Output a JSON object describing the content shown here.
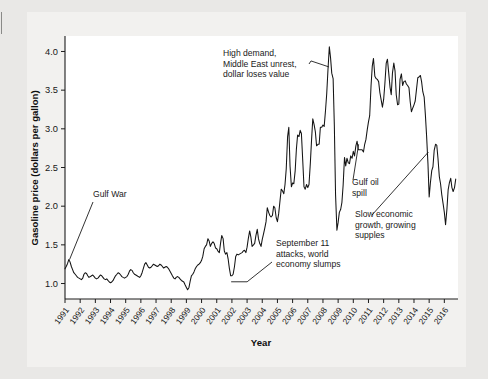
{
  "figure": {
    "background_color": "#e9e8e6",
    "panel_color": "#f2f1ef",
    "plot_color": "#ffffff",
    "line_color": "#141414"
  },
  "chart_data": {
    "type": "line",
    "title": "",
    "xlabel": "Year",
    "ylabel": "Gasoline price (dollars per gallon)",
    "xlim": [
      1991,
      2016.9
    ],
    "ylim": [
      0.8,
      4.2
    ],
    "ytick_labels": [
      "1.0",
      "1.5",
      "2.0",
      "2.5",
      "3.0",
      "3.5",
      "4.0"
    ],
    "ytick_values": [
      1.0,
      1.5,
      2.0,
      2.5,
      3.0,
      3.5,
      4.0
    ],
    "xtick_labels": [
      "1991",
      "1992",
      "1993",
      "1994",
      "1995",
      "1996",
      "1997",
      "1998",
      "1999",
      "2000",
      "2001",
      "2002",
      "2003",
      "2004",
      "2005",
      "2006",
      "2007",
      "2008",
      "2009",
      "2010",
      "2011",
      "2012",
      "2013",
      "2014",
      "2015",
      "2016"
    ],
    "xtick_values": [
      1991,
      1992,
      1993,
      1994,
      1995,
      1996,
      1997,
      1998,
      1999,
      2000,
      2001,
      2002,
      2003,
      2004,
      2005,
      2006,
      2007,
      2008,
      2009,
      2010,
      2011,
      2012,
      2013,
      2014,
      2015,
      2016
    ],
    "grid": false,
    "legend": null,
    "series": [
      {
        "name": "Gasoline price",
        "x": [
          1991.0,
          1991.08,
          1991.17,
          1991.25,
          1991.33,
          1991.42,
          1991.5,
          1991.58,
          1991.67,
          1991.75,
          1991.83,
          1991.92,
          1992.0,
          1992.08,
          1992.17,
          1992.25,
          1992.33,
          1992.42,
          1992.5,
          1992.58,
          1992.67,
          1992.75,
          1992.83,
          1992.92,
          1993.0,
          1993.08,
          1993.17,
          1993.25,
          1993.33,
          1993.42,
          1993.5,
          1993.58,
          1993.67,
          1993.75,
          1993.83,
          1993.92,
          1994.0,
          1994.08,
          1994.17,
          1994.25,
          1994.33,
          1994.42,
          1994.5,
          1994.58,
          1994.67,
          1994.75,
          1994.83,
          1994.92,
          1995.0,
          1995.08,
          1995.17,
          1995.25,
          1995.33,
          1995.42,
          1995.5,
          1995.58,
          1995.67,
          1995.75,
          1995.83,
          1995.92,
          1996.0,
          1996.08,
          1996.17,
          1996.25,
          1996.33,
          1996.42,
          1996.5,
          1996.58,
          1996.67,
          1996.75,
          1996.83,
          1996.92,
          1997.0,
          1997.08,
          1997.17,
          1997.25,
          1997.33,
          1997.42,
          1997.5,
          1997.58,
          1997.67,
          1997.75,
          1997.83,
          1997.92,
          1998.0,
          1998.08,
          1998.17,
          1998.25,
          1998.33,
          1998.42,
          1998.5,
          1998.58,
          1998.67,
          1998.75,
          1998.83,
          1998.92,
          1999.0,
          1999.08,
          1999.17,
          1999.25,
          1999.33,
          1999.42,
          1999.5,
          1999.58,
          1999.67,
          1999.75,
          1999.83,
          1999.92,
          2000.0,
          2000.08,
          2000.17,
          2000.25,
          2000.33,
          2000.42,
          2000.5,
          2000.58,
          2000.67,
          2000.75,
          2000.83,
          2000.92,
          2001.0,
          2001.08,
          2001.17,
          2001.25,
          2001.33,
          2001.42,
          2001.5,
          2001.58,
          2001.67,
          2001.75,
          2001.83,
          2001.92,
          2002.0,
          2002.08,
          2002.17,
          2002.25,
          2002.33,
          2002.42,
          2002.5,
          2002.58,
          2002.67,
          2002.75,
          2002.83,
          2002.92,
          2003.0,
          2003.08,
          2003.17,
          2003.25,
          2003.33,
          2003.42,
          2003.5,
          2003.58,
          2003.67,
          2003.75,
          2003.83,
          2003.92,
          2004.0,
          2004.08,
          2004.17,
          2004.25,
          2004.33,
          2004.42,
          2004.5,
          2004.58,
          2004.67,
          2004.75,
          2004.83,
          2004.92,
          2005.0,
          2005.08,
          2005.17,
          2005.25,
          2005.33,
          2005.42,
          2005.5,
          2005.58,
          2005.67,
          2005.75,
          2005.83,
          2005.92,
          2006.0,
          2006.08,
          2006.17,
          2006.25,
          2006.33,
          2006.42,
          2006.5,
          2006.58,
          2006.67,
          2006.75,
          2006.83,
          2006.92,
          2007.0,
          2007.08,
          2007.17,
          2007.25,
          2007.33,
          2007.42,
          2007.5,
          2007.58,
          2007.67,
          2007.75,
          2007.83,
          2007.92,
          2008.0,
          2008.08,
          2008.17,
          2008.25,
          2008.33,
          2008.42,
          2008.5,
          2008.58,
          2008.67,
          2008.75,
          2008.83,
          2008.92,
          2009.0,
          2009.08,
          2009.17,
          2009.25,
          2009.33,
          2009.42,
          2009.5,
          2009.58,
          2009.67,
          2009.75,
          2009.83,
          2009.92,
          2010.0,
          2010.08,
          2010.17,
          2010.25,
          2010.33,
          2010.42,
          2010.5,
          2010.58,
          2010.67,
          2010.75,
          2010.83,
          2010.92,
          2011.0,
          2011.08,
          2011.17,
          2011.25,
          2011.33,
          2011.42,
          2011.5,
          2011.58,
          2011.67,
          2011.75,
          2011.83,
          2011.92,
          2012.0,
          2012.08,
          2012.17,
          2012.25,
          2012.33,
          2012.42,
          2012.5,
          2012.58,
          2012.67,
          2012.75,
          2012.83,
          2012.92,
          2013.0,
          2013.08,
          2013.17,
          2013.25,
          2013.33,
          2013.42,
          2013.5,
          2013.58,
          2013.67,
          2013.75,
          2013.83,
          2013.92,
          2014.0,
          2014.08,
          2014.17,
          2014.25,
          2014.33,
          2014.42,
          2014.5,
          2014.58,
          2014.67,
          2014.75,
          2014.83,
          2014.92,
          2015.0,
          2015.08,
          2015.17,
          2015.25,
          2015.33,
          2015.42,
          2015.5,
          2015.58,
          2015.67,
          2015.75,
          2015.83,
          2015.92,
          2016.0,
          2016.08,
          2016.17,
          2016.25,
          2016.33,
          2016.42,
          2016.5,
          2016.58,
          2016.67,
          2016.75
        ],
        "values": [
          1.19,
          1.22,
          1.26,
          1.31,
          1.28,
          1.22,
          1.18,
          1.14,
          1.12,
          1.1,
          1.08,
          1.07,
          1.06,
          1.05,
          1.07,
          1.12,
          1.14,
          1.13,
          1.1,
          1.08,
          1.09,
          1.1,
          1.11,
          1.09,
          1.07,
          1.06,
          1.07,
          1.09,
          1.11,
          1.1,
          1.08,
          1.06,
          1.05,
          1.06,
          1.04,
          1.02,
          1.01,
          1.02,
          1.04,
          1.07,
          1.1,
          1.12,
          1.14,
          1.13,
          1.11,
          1.09,
          1.08,
          1.07,
          1.08,
          1.09,
          1.12,
          1.16,
          1.18,
          1.17,
          1.14,
          1.12,
          1.11,
          1.1,
          1.09,
          1.08,
          1.1,
          1.14,
          1.2,
          1.25,
          1.27,
          1.24,
          1.21,
          1.2,
          1.21,
          1.23,
          1.25,
          1.24,
          1.23,
          1.22,
          1.23,
          1.25,
          1.24,
          1.22,
          1.2,
          1.21,
          1.22,
          1.21,
          1.19,
          1.16,
          1.13,
          1.1,
          1.07,
          1.06,
          1.08,
          1.09,
          1.08,
          1.06,
          1.04,
          1.03,
          1.02,
          0.98,
          0.95,
          0.92,
          0.95,
          1.03,
          1.1,
          1.12,
          1.15,
          1.19,
          1.22,
          1.24,
          1.25,
          1.27,
          1.3,
          1.35,
          1.45,
          1.48,
          1.5,
          1.58,
          1.55,
          1.48,
          1.52,
          1.54,
          1.52,
          1.46,
          1.45,
          1.42,
          1.4,
          1.52,
          1.62,
          1.58,
          1.42,
          1.38,
          1.4,
          1.32,
          1.2,
          1.1,
          1.1,
          1.12,
          1.22,
          1.35,
          1.38,
          1.37,
          1.38,
          1.39,
          1.4,
          1.42,
          1.43,
          1.4,
          1.47,
          1.58,
          1.68,
          1.6,
          1.48,
          1.5,
          1.52,
          1.62,
          1.7,
          1.58,
          1.52,
          1.48,
          1.57,
          1.64,
          1.72,
          1.8,
          1.98,
          1.92,
          1.88,
          1.86,
          1.88,
          2.0,
          1.98,
          1.85,
          1.8,
          1.9,
          2.07,
          2.22,
          2.2,
          2.16,
          2.28,
          2.48,
          2.9,
          3.02,
          2.52,
          2.25,
          2.3,
          2.29,
          2.46,
          2.74,
          2.92,
          2.9,
          2.98,
          2.94,
          2.58,
          2.25,
          2.22,
          2.28,
          2.24,
          2.28,
          2.56,
          2.86,
          3.13,
          3.05,
          2.96,
          2.78,
          2.8,
          2.8,
          3.02,
          3.02,
          3.05,
          3.03,
          3.24,
          3.46,
          3.76,
          4.06,
          3.92,
          3.72,
          3.65,
          3.05,
          2.15,
          1.69,
          1.79,
          1.92,
          1.96,
          2.05,
          2.27,
          2.63,
          2.52,
          2.62,
          2.56,
          2.55,
          2.65,
          2.62,
          2.71,
          2.65,
          2.78,
          2.84,
          2.73,
          2.73,
          2.73,
          2.73,
          2.7,
          2.8,
          2.86,
          2.99,
          3.09,
          3.17,
          3.56,
          3.81,
          3.91,
          3.68,
          3.65,
          3.64,
          3.61,
          3.47,
          3.38,
          3.28,
          3.38,
          3.58,
          3.85,
          3.9,
          3.73,
          3.54,
          3.44,
          3.72,
          3.85,
          3.75,
          3.44,
          3.31,
          3.32,
          3.64,
          3.71,
          3.56,
          3.61,
          3.62,
          3.58,
          3.56,
          3.53,
          3.35,
          3.22,
          3.27,
          3.31,
          3.36,
          3.52,
          3.66,
          3.67,
          3.69,
          3.61,
          3.48,
          3.41,
          3.18,
          2.91,
          2.55,
          2.12,
          2.3,
          2.46,
          2.51,
          2.72,
          2.8,
          2.79,
          2.62,
          2.38,
          2.29,
          2.15,
          2.03,
          1.92,
          1.76,
          1.96,
          2.21,
          2.3,
          2.36,
          2.24,
          2.19,
          2.24,
          2.35
        ]
      }
    ],
    "annotations": [
      {
        "id": "gulf-war",
        "lines": [
          "Gulf War"
        ],
        "target_x": 1991.3,
        "target_y": 1.31
      },
      {
        "id": "high-demand",
        "lines": [
          "High demand,",
          "Middle East unrest,",
          "dollar loses value"
        ],
        "target_x": 2008.4,
        "target_y": 3.8
      },
      {
        "id": "september-11",
        "lines": [
          "September 11",
          "attacks, world",
          "economy slumps"
        ],
        "target_x": 2001.95,
        "target_y": 1.1
      },
      {
        "id": "gulf-oil-spill",
        "lines": [
          "Gulf oil",
          "spill"
        ],
        "target_x": 2010.35,
        "target_y": 2.8
      },
      {
        "id": "slow-growth",
        "lines": [
          "Slow economic",
          "growth, growing",
          "supples"
        ],
        "target_x": 2014.95,
        "target_y": 2.7
      }
    ]
  }
}
